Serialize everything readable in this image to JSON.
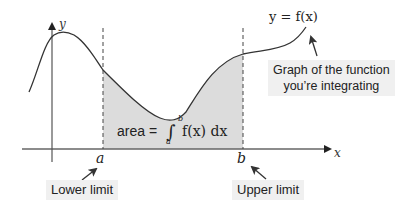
{
  "diagram": {
    "axes": {
      "x_label": "x",
      "y_label": "y"
    },
    "limits": {
      "lower_symbol": "a",
      "upper_symbol": "b"
    },
    "curve_label": "y = f(x)",
    "area_formula": {
      "prefix": "area =",
      "integral_sign": "∫",
      "lower": "a",
      "upper": "b",
      "integrand": "f(x) dx"
    },
    "callouts": {
      "function": {
        "line1": "Graph of the function",
        "line2": "you’re integrating"
      },
      "lower_limit": "Lower limit",
      "upper_limit": "Upper limit"
    },
    "colors": {
      "shade": "#dcdcdc",
      "curve": "#333333",
      "axis": "#555555",
      "label_bg": "#f0f0f0"
    }
  }
}
